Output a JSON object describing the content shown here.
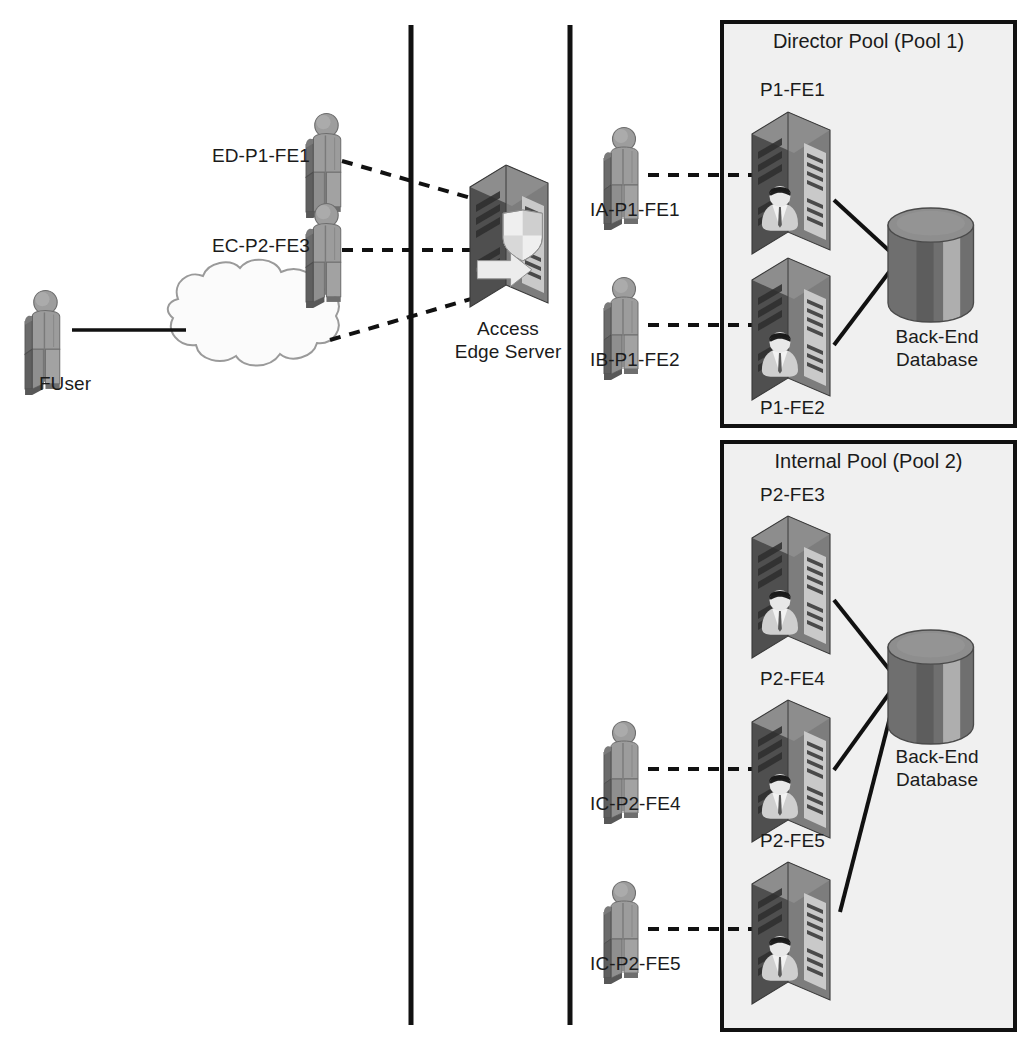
{
  "diagram": {
    "background": "#ffffff",
    "ink": "#1b1b1b",
    "pool_fill": "#f0f0f0",
    "pool_stroke": "#111111",
    "divider_color": "#111111",
    "server_dark": "#4d4d4d",
    "server_mid": "#6e6e6e",
    "server_light": "#9b9b9b",
    "person_body": "#8a8a8a",
    "person_shadow": "#5f5f5f",
    "db_dark": "#5a5a5a",
    "db_light": "#a8a8a8",
    "cloud_fill": "#fbfbfb",
    "cloud_stroke": "#9a9a9a"
  },
  "external": {
    "fuser": {
      "label": "FUser",
      "icon": "person-icon"
    },
    "cloud": {
      "icon": "cloud-icon",
      "label": ""
    },
    "clients": [
      {
        "label": "ED-P1-FE1",
        "icon": "person-icon"
      },
      {
        "label": "EC-P2-FE3",
        "icon": "person-icon"
      }
    ],
    "edge_server": {
      "label_line1": "Access",
      "label_line2": "Edge Server",
      "icon": "server-shield-icon"
    }
  },
  "internal": {
    "clients": [
      {
        "label": "IA-P1-FE1",
        "icon": "person-icon"
      },
      {
        "label": "IB-P1-FE2",
        "icon": "person-icon"
      },
      {
        "label": "IC-P2-FE4",
        "icon": "person-icon"
      },
      {
        "label": "IC-P2-FE5",
        "icon": "person-icon"
      }
    ]
  },
  "pools": [
    {
      "title": "Director Pool (Pool 1)",
      "servers": [
        {
          "label": "P1-FE1",
          "icon": "server-user-icon"
        },
        {
          "label": "P1-FE2",
          "icon": "server-user-icon"
        }
      ],
      "database": {
        "label_line1": "Back-End",
        "label_line2": "Database",
        "icon": "database-cylinder-icon"
      }
    },
    {
      "title": "Internal Pool (Pool 2)",
      "servers": [
        {
          "label": "P2-FE3",
          "icon": "server-user-icon"
        },
        {
          "label": "P2-FE4",
          "icon": "server-user-icon"
        },
        {
          "label": "P2-FE5",
          "icon": "server-user-icon"
        }
      ],
      "database": {
        "label_line1": "Back-End",
        "label_line2": "Database",
        "icon": "database-cylinder-icon"
      }
    }
  ],
  "connections": {
    "solid_note": "solid lines: front-end server to back-end database, FUser to cloud",
    "dashed_note": "dashed lines: client sign-in / registration paths"
  }
}
